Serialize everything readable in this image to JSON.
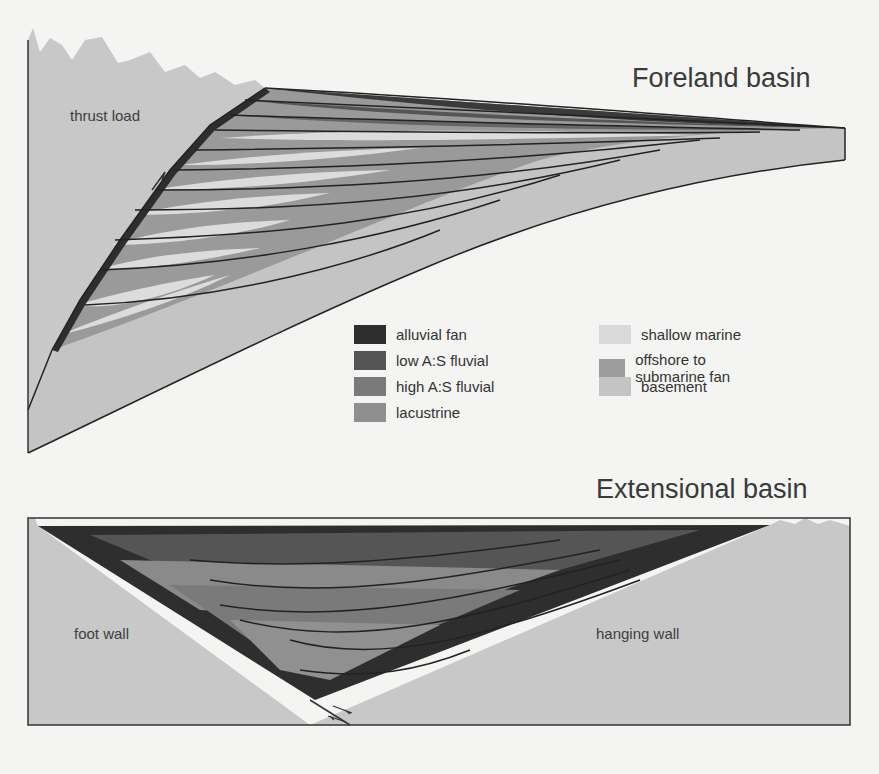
{
  "foreland": {
    "title": "Foreland basin",
    "label_thrust": "thrust load"
  },
  "extensional": {
    "title": "Extensional basin",
    "label_footwall": "foot wall",
    "label_hangingwall": "hanging wall"
  },
  "legend": [
    {
      "label": "alluvial fan",
      "color": "#2e2e2e"
    },
    {
      "label": "low A:S fluvial",
      "color": "#555555"
    },
    {
      "label": "high A:S fluvial",
      "color": "#7a7a7a"
    },
    {
      "label": "lacustrine",
      "color": "#8f8f8f"
    },
    {
      "label": "shallow marine",
      "color": "#dadada"
    },
    {
      "label": "offshore to submarine fan",
      "color": "#9c9c9c"
    },
    {
      "label": "basement",
      "color": "#c4c4c4"
    }
  ]
}
